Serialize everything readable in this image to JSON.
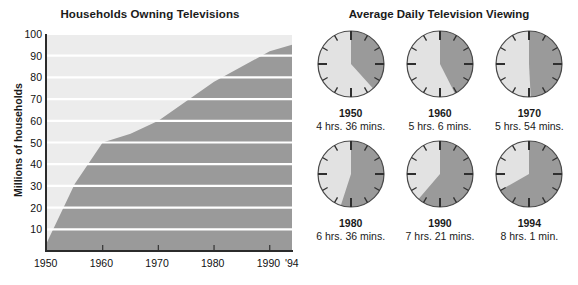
{
  "left": {
    "title": "Households Owning Televisions",
    "y_axis_title": "Millions of households",
    "y_ticks": [
      "100",
      "90",
      "80",
      "70",
      "60",
      "50",
      "40",
      "30",
      "20",
      "10"
    ],
    "x_ticks": [
      "1950",
      "1960",
      "1970",
      "1980",
      "1990",
      "'94"
    ]
  },
  "right": {
    "title": "Average Daily Television Viewing",
    "clocks": [
      {
        "year": "1950",
        "duration": "4 hrs. 36 mins.",
        "hours": 4.6
      },
      {
        "year": "1960",
        "duration": "5 hrs. 6 mins.",
        "hours": 5.1
      },
      {
        "year": "1970",
        "duration": "5 hrs. 54 mins.",
        "hours": 5.9
      },
      {
        "year": "1980",
        "duration": "6 hrs. 36 mins.",
        "hours": 6.6
      },
      {
        "year": "1990",
        "duration": "7 hrs. 21 mins.",
        "hours": 7.35
      },
      {
        "year": "1994",
        "duration": "8 hrs. 1 min.",
        "hours": 8.0167
      }
    ]
  },
  "colors": {
    "area_fill": "#9a9a9a",
    "plot_background": "#ececec",
    "gridline": "#ffffff",
    "axis": "#2b2b2b",
    "clock_fill_dark": "#9a9a9a",
    "clock_fill_light": "#e2e2e2",
    "clock_outline": "#4a4a4a",
    "text": "#1a1a1a"
  },
  "chart_data": [
    {
      "type": "area",
      "title": "Households Owning Televisions",
      "xlabel": "",
      "ylabel": "Millions of households",
      "xlim": [
        1950,
        1994
      ],
      "ylim": [
        0,
        100
      ],
      "grid": true,
      "legend": "none",
      "x": [
        1950,
        1955,
        1960,
        1965,
        1970,
        1975,
        1980,
        1985,
        1990,
        1994
      ],
      "values": [
        4,
        31,
        50,
        54,
        60,
        69,
        78,
        85,
        92,
        95
      ],
      "y_tick_labels": [
        "10",
        "20",
        "30",
        "40",
        "50",
        "60",
        "70",
        "80",
        "90",
        "100"
      ],
      "x_tick_labels": [
        "1950",
        "1960",
        "1970",
        "1980",
        "1990",
        "'94"
      ]
    },
    {
      "type": "pie",
      "title": "Average Daily Television Viewing",
      "unit": "hours per day (out of 12-hour clock face)",
      "categories": [
        "1950",
        "1960",
        "1970",
        "1980",
        "1990",
        "1994"
      ],
      "values": [
        4.6,
        5.1,
        5.9,
        6.6,
        7.35,
        8.0167
      ],
      "labels": [
        "4 hrs. 36 mins.",
        "5 hrs. 6 mins.",
        "5 hrs. 54 mins.",
        "6 hrs. 36 mins.",
        "7 hrs. 21 mins.",
        "8 hrs. 1 min."
      ]
    }
  ]
}
